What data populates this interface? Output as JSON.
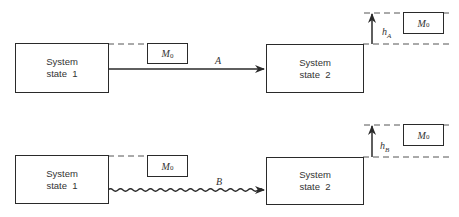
{
  "diagram": {
    "process_a": {
      "initial_state_label": [
        "System",
        "state  1"
      ],
      "final_state_label": [
        "System",
        "state  2"
      ],
      "mass_initial": {
        "symbol": "M",
        "subscript": "0"
      },
      "mass_final": {
        "symbol": "M",
        "subscript": "0"
      },
      "path_label": "A",
      "path_style": "straight",
      "height_label": {
        "symbol": "h",
        "subscript": "A"
      }
    },
    "process_b": {
      "initial_state_label": [
        "System",
        "state  1"
      ],
      "final_state_label": [
        "System",
        "state  2"
      ],
      "mass_initial": {
        "symbol": "M",
        "subscript": "0"
      },
      "mass_final": {
        "symbol": "M",
        "subscript": "0"
      },
      "path_label": "B",
      "path_style": "wavy",
      "height_label": {
        "symbol": "h",
        "subscript": "B"
      }
    },
    "colors": {
      "line": "#2a2a2a",
      "dash": "#555555"
    }
  }
}
